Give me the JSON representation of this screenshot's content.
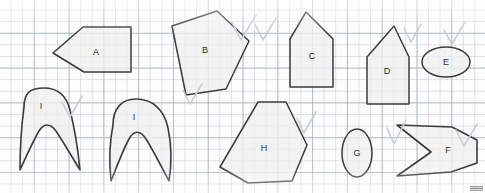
{
  "worksheet": {
    "title": "Geometric Shapes Grid Worksheet",
    "background": "graph-paper",
    "grid_color": "#aab4c3",
    "grid_minor_spacing_px": 11.6,
    "grid_major_spacing_px": 34.8,
    "shape_fill_color": "#f0f0f0",
    "shape_stroke_color": "#3b3b3b",
    "check_mark_color": "#c9cdd4",
    "corner_watermark": ""
  },
  "shapes": [
    {
      "id": "shape-a",
      "label": "A",
      "kind": "pentagon",
      "label_x": 96,
      "label_y": 52,
      "points": "53,53 83,27 131,27 131,72 84,72",
      "has_check": false
    },
    {
      "id": "shape-b",
      "label": "B",
      "kind": "pentagon",
      "label_x": 205,
      "label_y": 50,
      "points": "172,26 217,11 249,41 226,89 186,95",
      "has_check": true
    },
    {
      "id": "shape-c",
      "label": "C",
      "kind": "house-pentagon",
      "label_x": 312,
      "label_y": 56,
      "points": "306,12 333,39 333,87 290,87 290,39",
      "has_check": true
    },
    {
      "id": "shape-d",
      "label": "D",
      "kind": "house-pentagon",
      "label_x": 387,
      "label_y": 71,
      "points": "394,26 409,57 409,104 367,104 367,57",
      "has_check": true
    },
    {
      "id": "shape-e",
      "label": "E",
      "kind": "ellipse-horizontal",
      "label_x": 446,
      "label_y": 62,
      "cx": 446,
      "cy": 62,
      "rx": 24,
      "ry": 15,
      "has_check": true
    },
    {
      "id": "shape-f",
      "label": "F",
      "kind": "concave-chevron",
      "label_x": 448,
      "label_y": 150,
      "path": "M 397,125 L 452,127 L 477,140 L 477,163 L 451,172 L 397,176 L 431,152 Z",
      "has_check": true
    },
    {
      "id": "shape-g",
      "label": "G",
      "kind": "ellipse-vertical",
      "label_x": 357,
      "label_y": 153,
      "cx": 357,
      "cy": 153,
      "rx": 15,
      "ry": 24,
      "has_check": true
    },
    {
      "id": "shape-h",
      "label": "H",
      "kind": "hexagon",
      "label_x": 264,
      "label_y": 148,
      "points": "258,102 286,102 307,145 292,181 248,183 220,167",
      "has_check": true
    },
    {
      "id": "shape-i-1",
      "label": "I",
      "kind": "curved-arch",
      "label_x": 41,
      "label_y": 106,
      "path": "M 24,107 C 24,92 31,88 44,88 C 57,88 66,94 70,110 C 74,126 78,150 80,170 C 72,157 64,143 56,131 C 50,123 44,123 39,131 C 33,141 27,155 20,170 C 20,150 22,122 24,107 Z",
      "has_check": true
    },
    {
      "id": "shape-i-2",
      "label": "I",
      "kind": "curved-arch",
      "label_x": 134,
      "label_y": 117,
      "path": "M 113,125 C 113,108 122,99 136,99 C 152,99 164,109 168,128 C 172,147 172,163 169,181 C 161,166 153,150 146,139 C 140,130 134,130 129,139 C 123,150 117,166 111,181 C 109,162 110,140 113,125 Z",
      "has_check": false
    }
  ],
  "check_marks": [
    {
      "id": "check-b",
      "path": "M 232,22 L 241,40 L 256,15"
    },
    {
      "id": "check-c",
      "path": "M 255,24 L 263,40 L 276,18"
    },
    {
      "id": "check-d",
      "path": "M 404,28 L 411,42 L 421,24"
    },
    {
      "id": "check-e",
      "path": "M 444,30 L 452,44 L 465,22"
    },
    {
      "id": "check-f",
      "path": "M 456,130 L 464,146 L 477,124"
    },
    {
      "id": "check-g",
      "path": "M 387,128 L 394,144 L 406,120"
    },
    {
      "id": "check-h",
      "path": "M 297,118 L 304,133 L 316,112"
    },
    {
      "id": "check-i1",
      "path": "M 62,102 L 70,117 L 82,96"
    },
    {
      "id": "check-i2",
      "path": "M 183,90 L 190,104 L 202,84"
    }
  ]
}
